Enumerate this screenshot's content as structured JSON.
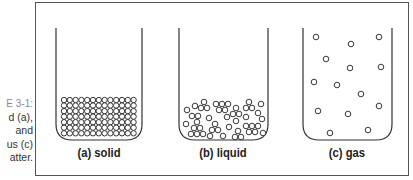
{
  "caption": {
    "figure": "E 3-1:",
    "lines": [
      "d (a),",
      "and",
      "us (c)",
      "atter."
    ]
  },
  "colors": {
    "stroke": "#333333",
    "frame": "#555555",
    "caption_figure": "#8a8a8a"
  },
  "beakers": [
    {
      "id": "a",
      "label": "(a) solid",
      "state": "solid",
      "grid": {
        "columns": 13,
        "rows": 7
      }
    },
    {
      "id": "b",
      "label": "(b) liquid",
      "state": "liquid"
    },
    {
      "id": "c",
      "label": "(c) gas",
      "state": "gas",
      "particle_count": 14
    }
  ]
}
